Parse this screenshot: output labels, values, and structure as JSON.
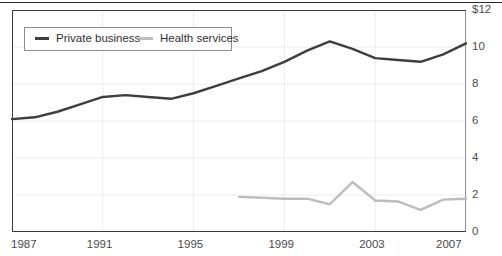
{
  "chart_data": {
    "type": "line",
    "title": "",
    "xlabel": "",
    "ylabel": "",
    "xlim": [
      1987,
      2007
    ],
    "ylim": [
      0,
      12
    ],
    "grid": true,
    "legend_position": "top-left",
    "x_ticks": [
      "1987",
      "1991",
      "1995",
      "1999",
      "2003",
      "2007"
    ],
    "x_tick_values": [
      1987,
      1991,
      1995,
      1999,
      2003,
      2007
    ],
    "y_ticks": [
      "$12",
      "10",
      "8",
      "6",
      "4",
      "2",
      "0"
    ],
    "y_tick_values": [
      12,
      10,
      8,
      6,
      4,
      2,
      0
    ],
    "x": [
      1987,
      1988,
      1989,
      1990,
      1991,
      1992,
      1993,
      1994,
      1995,
      1996,
      1997,
      1998,
      1999,
      2000,
      2001,
      2002,
      2003,
      2004,
      2005,
      2006,
      2007
    ],
    "series": [
      {
        "name": "Private business",
        "color": "#3e3e3e",
        "values": [
          6.1,
          6.2,
          6.5,
          6.9,
          7.3,
          7.4,
          7.3,
          7.2,
          7.5,
          7.9,
          8.3,
          8.7,
          9.2,
          9.8,
          10.3,
          9.9,
          9.4,
          9.3,
          9.2,
          9.6,
          10.2
        ]
      },
      {
        "name": "Health services",
        "color": "#bdbdbd",
        "values": [
          null,
          null,
          null,
          null,
          null,
          null,
          null,
          null,
          null,
          null,
          1.9,
          1.85,
          1.8,
          1.8,
          1.5,
          2.7,
          1.7,
          1.65,
          1.2,
          1.75,
          1.8
        ]
      }
    ]
  },
  "legend": {
    "items": [
      {
        "label": "Private business",
        "color": "#3e3e3e"
      },
      {
        "label": "Health services",
        "color": "#bdbdbd"
      }
    ]
  },
  "axis": {
    "y_labels": [
      "$12",
      "10",
      "8",
      "6",
      "4",
      "2",
      "0"
    ],
    "x_labels": [
      "1987",
      "1991",
      "1995",
      "1999",
      "2003",
      "2007"
    ]
  }
}
